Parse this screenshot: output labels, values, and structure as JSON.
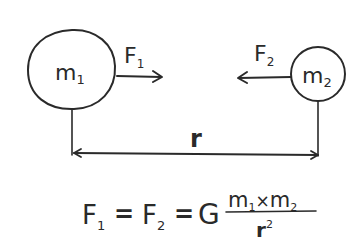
{
  "diagram": {
    "mass1": {
      "symbol": "m",
      "subscript": "1"
    },
    "mass2": {
      "symbol": "m",
      "subscript": "2"
    },
    "force1": {
      "symbol": "F",
      "subscript": "1",
      "direction": "right"
    },
    "force2": {
      "symbol": "F",
      "subscript": "2",
      "direction": "left"
    },
    "distance": {
      "symbol": "r"
    },
    "formula": {
      "lhs1": {
        "symbol": "F",
        "subscript": "1"
      },
      "eq1": "=",
      "lhs2": {
        "symbol": "F",
        "subscript": "2"
      },
      "eq2": "=",
      "constant": "G",
      "numerator": {
        "m1": "m",
        "m1_sub": "1",
        "times": "×",
        "m2": "m",
        "m2_sub": "2"
      },
      "denominator": {
        "base": "r",
        "exponent": "2"
      }
    },
    "colors": {
      "ink": "#2a2a2a",
      "background": "#ffffff"
    }
  }
}
